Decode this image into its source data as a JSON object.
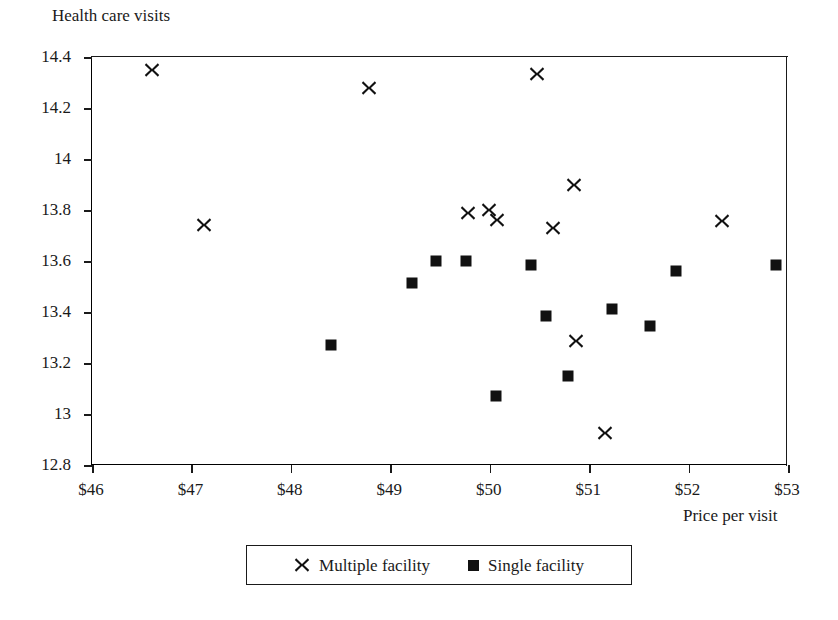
{
  "chart_data": {
    "type": "scatter",
    "title": "",
    "ylabel": "Health care visits",
    "xlabel": "Price per visit",
    "xlim": [
      46,
      53
    ],
    "ylim": [
      12.8,
      14.4
    ],
    "xticks": [
      "$46",
      "$47",
      "$48",
      "$49",
      "$50",
      "$51",
      "$52",
      "$53"
    ],
    "xtick_values": [
      46,
      47,
      48,
      49,
      50,
      51,
      52,
      53
    ],
    "yticks": [
      "12.8",
      "13",
      "13.2",
      "13.4",
      "13.6",
      "13.8",
      "14",
      "14.2",
      "14.4"
    ],
    "ytick_values": [
      12.8,
      13.0,
      13.2,
      13.4,
      13.6,
      13.8,
      14.0,
      14.2,
      14.4
    ],
    "grid": false,
    "legend_position": "below-center",
    "marker_color": "#111111",
    "series": [
      {
        "name": "Multiple facility",
        "marker": "x",
        "points": [
          {
            "x": 46.6,
            "y": 14.35
          },
          {
            "x": 47.13,
            "y": 13.74
          },
          {
            "x": 48.79,
            "y": 14.28
          },
          {
            "x": 49.78,
            "y": 13.79
          },
          {
            "x": 49.99,
            "y": 13.8
          },
          {
            "x": 50.07,
            "y": 13.76
          },
          {
            "x": 50.48,
            "y": 14.335
          },
          {
            "x": 50.64,
            "y": 13.73
          },
          {
            "x": 50.85,
            "y": 13.9
          },
          {
            "x": 50.87,
            "y": 13.285
          },
          {
            "x": 51.16,
            "y": 12.925
          },
          {
            "x": 52.34,
            "y": 13.755
          }
        ]
      },
      {
        "name": "Single facility",
        "marker": "square",
        "points": [
          {
            "x": 48.4,
            "y": 13.27
          },
          {
            "x": 49.22,
            "y": 13.515
          },
          {
            "x": 49.46,
            "y": 13.6
          },
          {
            "x": 49.76,
            "y": 13.6
          },
          {
            "x": 50.06,
            "y": 13.07
          },
          {
            "x": 50.42,
            "y": 13.585
          },
          {
            "x": 50.57,
            "y": 13.385
          },
          {
            "x": 50.79,
            "y": 13.15
          },
          {
            "x": 51.23,
            "y": 13.41
          },
          {
            "x": 51.61,
            "y": 13.345
          },
          {
            "x": 51.87,
            "y": 13.56
          },
          {
            "x": 52.88,
            "y": 13.585
          }
        ]
      }
    ]
  },
  "legend": {
    "items": [
      {
        "label": "Multiple facility",
        "marker": "x"
      },
      {
        "label": "Single facility",
        "marker": "square"
      }
    ]
  }
}
